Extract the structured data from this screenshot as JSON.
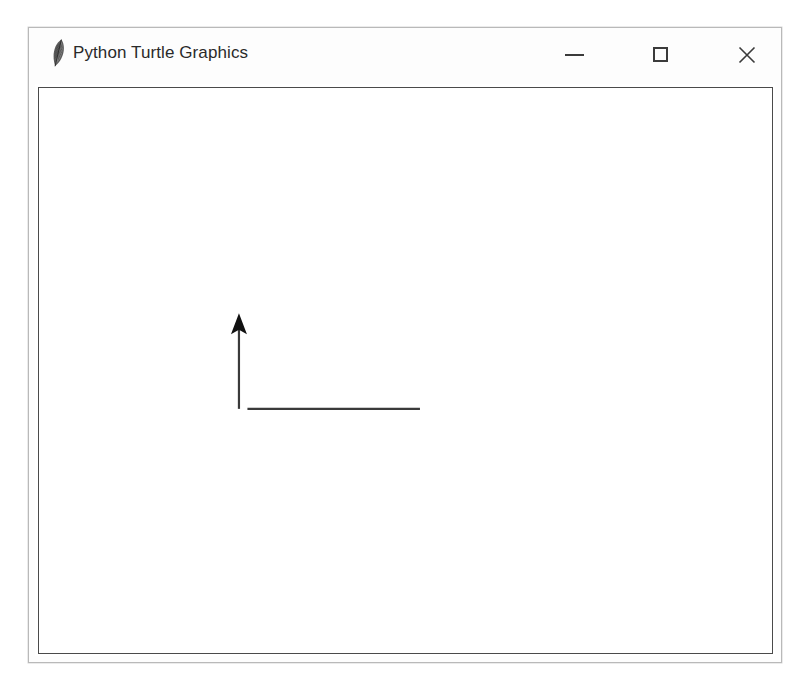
{
  "window": {
    "title": "Python Turtle Graphics",
    "icon": "python-feather-icon",
    "background_color": "#ffffff",
    "titlebar_color": "#fdfdfd",
    "border_color": "#b9b9b9",
    "controls": {
      "minimize_label": "—",
      "maximize_label": "□",
      "close_label": "✕",
      "minimize_name": "minimize-icon",
      "maximize_name": "maximize-icon",
      "close_name": "close-icon"
    }
  },
  "canvas": {
    "background_color": "#ffffff",
    "border_color": "#4a4a4a",
    "pen_color": "#3a3a3a",
    "pen_width": 2,
    "turtle": {
      "shape": "arrow",
      "heading_degrees": 90,
      "fill_color": "#111111",
      "position_x": 234,
      "position_y": 285
    },
    "drawing": {
      "description": "L-shaped path: horizontal line then vertical line with turtle at top",
      "segments": [
        {
          "name": "horizontal-line",
          "x1": 415,
          "y1": 381,
          "x2": 234,
          "y2": 381
        },
        {
          "name": "vertical-line",
          "x1": 234,
          "y1": 381,
          "x2": 234,
          "y2": 297
        }
      ]
    }
  }
}
